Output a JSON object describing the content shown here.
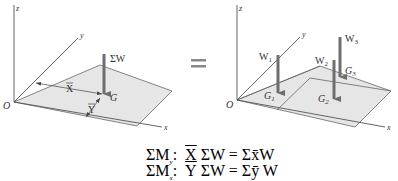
{
  "left_figure": {
    "axes": {
      "z": "z",
      "y": "y",
      "x": "x",
      "origin": "O"
    },
    "force_label": "ΣW",
    "centroid_label": "G",
    "xbar_label": "X",
    "ybar_label": "Y"
  },
  "equals_sign": "=",
  "right_figure": {
    "axes": {
      "z": "z",
      "y": "y",
      "x": "x",
      "origin": "O"
    },
    "forces": [
      {
        "label": "W",
        "sub": "1",
        "centroid": "G",
        "centroid_sub": "1"
      },
      {
        "label": "W",
        "sub": "2",
        "centroid": "G",
        "centroid_sub": "2"
      },
      {
        "label": "W",
        "sub": "3",
        "centroid": "G",
        "centroid_sub": "3"
      }
    ]
  },
  "equations": [
    {
      "lhs": "ΣM",
      "lhs_sub": "y",
      "colon": ":",
      "bar_var": "X",
      "rest": "ΣW = Σx̄W"
    },
    {
      "lhs": "ΣM",
      "lhs_sub": "x",
      "colon": ":",
      "bar_var": "Y",
      "rest": "ΣW = Σȳ W"
    }
  ],
  "colors": {
    "plate_fill": "#e6e6e6",
    "line": "#555555",
    "arrow": "#6e6e6e"
  }
}
